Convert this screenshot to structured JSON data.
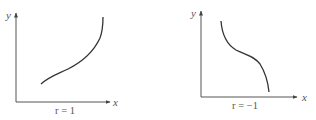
{
  "figures": [
    {
      "id": "positive",
      "caption": "r = 1",
      "x_label": "x",
      "y_label": "y",
      "description": "increasing S-shaped curve"
    },
    {
      "id": "negative",
      "caption": "r = −1",
      "x_label": "x",
      "y_label": "y",
      "description": "decreasing S-shaped curve"
    }
  ],
  "colors": {
    "axis": "#555555",
    "curve": "#333333",
    "text": "#555555"
  }
}
